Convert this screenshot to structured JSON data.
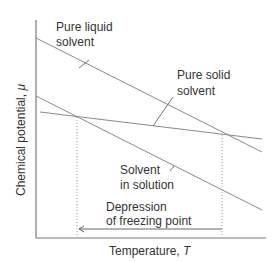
{
  "diagram": {
    "type": "chemical-potential-vs-temperature",
    "x_axis_label": "Temperature, ",
    "x_axis_symbol": "T",
    "y_axis_label": "Chemical potential, ",
    "y_axis_symbol": "μ",
    "lines": [
      {
        "id": "pure-liquid",
        "label_line1": "Pure liquid",
        "label_line2": "solvent"
      },
      {
        "id": "pure-solid",
        "label_line1": "Pure solid",
        "label_line2": "solvent"
      },
      {
        "id": "solution",
        "label_line1": "Solvent",
        "label_line2": "in solution"
      }
    ],
    "annotation": {
      "line1": "Depression",
      "line2": "of freezing point"
    }
  }
}
